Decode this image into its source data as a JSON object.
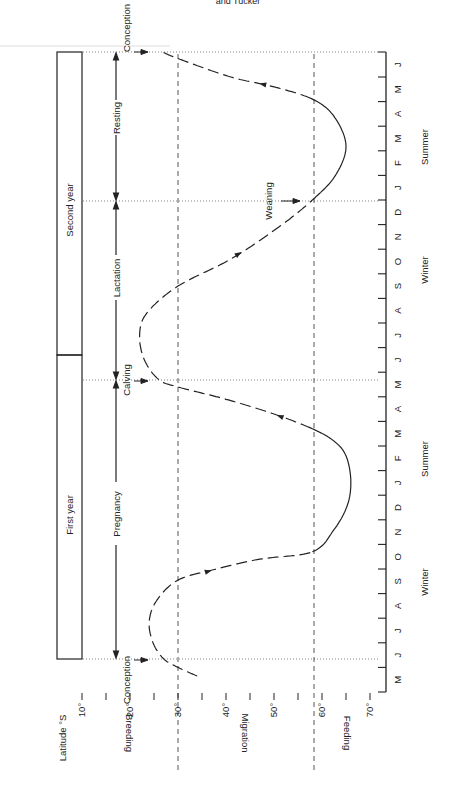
{
  "header": {
    "running_head": "and Tucker"
  },
  "chart_data": {
    "type": "line",
    "title": "",
    "orientation": "rotated-90-ccw",
    "xlabel": "Month",
    "ylabel": "Latitude °S",
    "ylim": [
      10,
      70
    ],
    "y_ticks": [
      "10°",
      "20°",
      "30°",
      "40°",
      "50°",
      "60°",
      "70°"
    ],
    "y_tick_values": [
      10,
      20,
      30,
      40,
      50,
      60,
      70
    ],
    "zones": [
      {
        "label": "Breeding",
        "from": 10,
        "to": 30
      },
      {
        "label": "Migration",
        "from": 30,
        "to": 58
      },
      {
        "label": "Feeding",
        "from": 58,
        "to": 70
      }
    ],
    "zone_boundaries": [
      30,
      58
    ],
    "months": [
      "M",
      "J",
      "J",
      "A",
      "S",
      "O",
      "N",
      "D",
      "J",
      "F",
      "M",
      "A",
      "M",
      "J",
      "J",
      "A",
      "S",
      "O",
      "N",
      "D",
      "J",
      "F",
      "M",
      "A",
      "M",
      "J"
    ],
    "seasons": [
      {
        "label": "Winter",
        "month_center": 4.5
      },
      {
        "label": "Summer",
        "month_center": 9.0
      },
      {
        "label": "Winter",
        "month_center": 16.5
      },
      {
        "label": "Summer",
        "month_center": 21.0
      }
    ],
    "years": [
      {
        "label": "First year",
        "from_month": 1.35,
        "to_month": 13.7
      },
      {
        "label": "Second year",
        "from_month": 13.7,
        "to_month": 26.0
      }
    ],
    "events": [
      {
        "label": "Conception",
        "month": 1.35
      },
      {
        "label": "Calving",
        "month": 12.7
      },
      {
        "label": "Weaning",
        "month": 20.0
      },
      {
        "label": "Conception",
        "month": 26.0
      }
    ],
    "phases": [
      {
        "label": "Pregnancy",
        "from_month": 1.35,
        "to_month": 12.7
      },
      {
        "label": "Lactation",
        "from_month": 12.7,
        "to_month": 20.0
      },
      {
        "label": "Resting",
        "from_month": 20.0,
        "to_month": 26.0
      }
    ],
    "series": [
      {
        "name": "Whale latitude",
        "points": [
          [
            0.65,
            34
          ],
          [
            1.0,
            30
          ],
          [
            1.35,
            27
          ],
          [
            2.0,
            24.8
          ],
          [
            2.85,
            24
          ],
          [
            3.7,
            25.5
          ],
          [
            4.55,
            30
          ],
          [
            5.0,
            38
          ],
          [
            5.4,
            47
          ],
          [
            5.7,
            58
          ],
          [
            6.6,
            62.5
          ],
          [
            7.6,
            65.3
          ],
          [
            8.6,
            66
          ],
          [
            9.6,
            65
          ],
          [
            10.2,
            62.5
          ],
          [
            10.7,
            58
          ],
          [
            11.3,
            50
          ],
          [
            11.9,
            40
          ],
          [
            12.4,
            30
          ],
          [
            12.7,
            26
          ],
          [
            13.5,
            23
          ],
          [
            14.5,
            22
          ],
          [
            15.4,
            23.5
          ],
          [
            16.5,
            30
          ],
          [
            17.6,
            41
          ],
          [
            18.9,
            51
          ],
          [
            20.0,
            58
          ],
          [
            21.0,
            62.8
          ],
          [
            22.2,
            65
          ],
          [
            23.4,
            62.5
          ],
          [
            24.1,
            58
          ],
          [
            24.6,
            50
          ],
          [
            25.0,
            41
          ],
          [
            25.75,
            30
          ],
          [
            26.0,
            27
          ]
        ],
        "dashed_when_migrating": true,
        "direction_arrows_at_months": [
          4.9,
          11.2,
          17.8,
          24.7
        ]
      }
    ],
    "grid": false,
    "legend": null
  },
  "labels": {
    "latitude_axis": "Latitude °S",
    "breeding": "Breeding",
    "migration": "Migration",
    "feeding": "Feeding",
    "first_year": "First year",
    "second_year": "Second year",
    "pregnancy": "Pregnancy",
    "lactation": "Lactation",
    "resting": "Resting",
    "conception_1": "Conception",
    "calving": "Calving",
    "weaning": "Weaning",
    "conception_2": "Conception",
    "winter_1": "Winter",
    "summer_1": "Summer",
    "winter_2": "Winter",
    "summer_2": "Summer"
  }
}
